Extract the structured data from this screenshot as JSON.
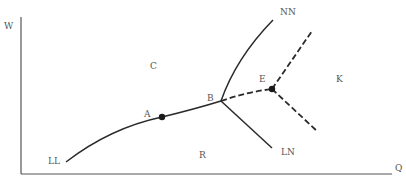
{
  "axes": {
    "y_label": "W",
    "x_label": "Q"
  },
  "regions": {
    "c": "C",
    "k": "K",
    "r": "R"
  },
  "points": {
    "a": "A",
    "b": "B",
    "e": "E"
  },
  "curves": {
    "ll": "LL",
    "nn": "NN",
    "ln": "LN"
  },
  "colors": {
    "line": "#2a2a2a",
    "text": "#555555",
    "axis": "#555555"
  }
}
